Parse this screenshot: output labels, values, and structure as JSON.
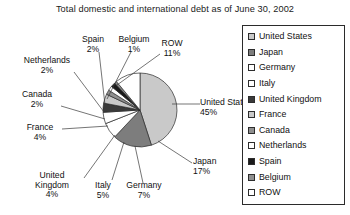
{
  "chart": {
    "title": "Total domestic and international debt as of June 30, 2002"
  },
  "chart_data": {
    "type": "pie",
    "title": "Total domestic and international debt as of June 30, 2002",
    "xlabel": "",
    "ylabel": "",
    "unit": "percent",
    "grid": false,
    "legend_position": "right",
    "start_angle_deg": 0,
    "direction": "clockwise",
    "categories": [
      "United States",
      "Japan",
      "Germany",
      "Italy",
      "United Kingdom",
      "France",
      "Canada",
      "Netherlands",
      "Spain",
      "Belgium",
      "ROW"
    ],
    "values": [
      45,
      17,
      7,
      5,
      4,
      4,
      2,
      2,
      2,
      1,
      11
    ],
    "value_labels": [
      "45%",
      "17%",
      "7%",
      "5%",
      "4%",
      "4%",
      "2%",
      "2%",
      "2%",
      "1%",
      "11%"
    ],
    "colors": [
      "#c9c9c9",
      "#7d7d7d",
      "#ffffff",
      "#ffffff",
      "#3a3a3a",
      "#c9c9c9",
      "#8f8f8f",
      "#ffffff",
      "#1a1a1a",
      "#8f8f8f",
      "#ffffff"
    ]
  },
  "legend": {
    "items": [
      {
        "label": "United States",
        "color": "#c9c9c9"
      },
      {
        "label": "Japan",
        "color": "#7d7d7d"
      },
      {
        "label": "Germany",
        "color": "#ffffff"
      },
      {
        "label": "Italy",
        "color": "#ffffff"
      },
      {
        "label": "United Kingdom",
        "color": "#3a3a3a"
      },
      {
        "label": "France",
        "color": "#c9c9c9"
      },
      {
        "label": "Canada",
        "color": "#8f8f8f"
      },
      {
        "label": "Netherlands",
        "color": "#ffffff"
      },
      {
        "label": "Spain",
        "color": "#1a1a1a"
      },
      {
        "label": "Belgium",
        "color": "#8f8f8f"
      },
      {
        "label": "ROW",
        "color": "#ffffff"
      }
    ]
  },
  "callouts": [
    {
      "name": "United States",
      "pct": "45%"
    },
    {
      "name": "Japan",
      "pct": "17%"
    },
    {
      "name": "Germany",
      "pct": "7%"
    },
    {
      "name": "Italy",
      "pct": "5%"
    },
    {
      "name": "United Kingdom",
      "name_line1": "United",
      "name_line2": "Kingdom",
      "pct": "4%"
    },
    {
      "name": "France",
      "pct": "4%"
    },
    {
      "name": "Canada",
      "pct": "2%"
    },
    {
      "name": "Netherlands",
      "pct": "2%"
    },
    {
      "name": "Spain",
      "pct": "2%"
    },
    {
      "name": "Belgium",
      "pct": "1%"
    },
    {
      "name": "ROW",
      "pct": "11%"
    }
  ]
}
